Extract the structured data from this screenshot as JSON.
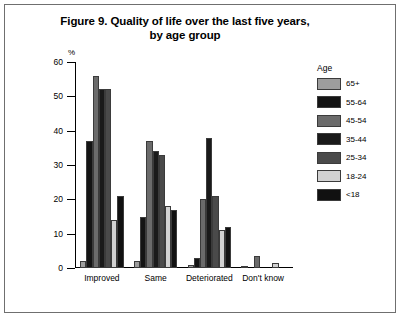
{
  "figure": {
    "title_line1": "Figure 9. Quality of life over the last five years,",
    "title_line2": "by age group",
    "y_axis_unit": "%",
    "legend_title": "Age"
  },
  "chart_data": {
    "type": "bar",
    "title": "Figure 9. Quality of life over the last five years, by age group",
    "xlabel": "",
    "ylabel": "%",
    "ylim": [
      0,
      60
    ],
    "yticks": [
      0,
      10,
      20,
      30,
      40,
      50,
      60
    ],
    "grid": false,
    "legend_position": "right",
    "categories": [
      "Improved",
      "Same",
      "Deteriorated",
      "Don't know"
    ],
    "series": [
      {
        "name": "65+",
        "color": "#9d9d9d",
        "values": [
          2,
          2,
          1,
          0.5
        ]
      },
      {
        "name": "55-64",
        "color": "#141414",
        "values": [
          37,
          15,
          3,
          0
        ]
      },
      {
        "name": "45-54",
        "color": "#6b6b6b",
        "values": [
          56,
          37,
          20,
          3.5
        ]
      },
      {
        "name": "35-44",
        "color": "#1a1a1a",
        "values": [
          52,
          34,
          38,
          0
        ]
      },
      {
        "name": "25-34",
        "color": "#4a4a4a",
        "values": [
          52,
          33,
          21,
          0
        ]
      },
      {
        "name": "18-24",
        "color": "#d2d2d2",
        "values": [
          14,
          18,
          11,
          1.5
        ]
      },
      {
        "name": "<18",
        "color": "#111111",
        "values": [
          21,
          17,
          12,
          0
        ]
      }
    ]
  }
}
